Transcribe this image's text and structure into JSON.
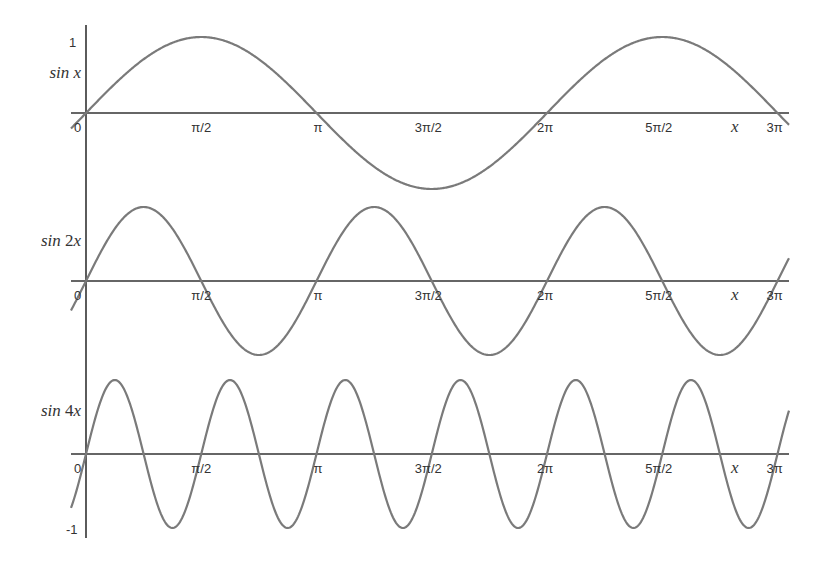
{
  "chart_data": [
    {
      "type": "line",
      "title": "",
      "series": [
        {
          "name": "sin x",
          "function": "sin(1*x)",
          "frequency": 1,
          "amplitude": 1
        }
      ],
      "ylabel": "sin x",
      "xlabel": "x",
      "xlim": [
        0,
        9.4248
      ],
      "ylim": [
        -1,
        1
      ],
      "x_tick_labels": [
        "0",
        "π/2",
        "π",
        "3π/2",
        "2π",
        "5π/2",
        "3π"
      ],
      "y_tick_labels": [
        "1"
      ],
      "grid": false
    },
    {
      "type": "line",
      "title": "",
      "series": [
        {
          "name": "sin 2x",
          "function": "sin(2*x)",
          "frequency": 2,
          "amplitude": 1
        }
      ],
      "ylabel": "sin 2x",
      "xlabel": "x",
      "xlim": [
        0,
        9.4248
      ],
      "ylim": [
        -1,
        1
      ],
      "x_tick_labels": [
        "0",
        "π/2",
        "π",
        "3π/2",
        "2π",
        "5π/2",
        "3π"
      ],
      "grid": false
    },
    {
      "type": "line",
      "title": "",
      "series": [
        {
          "name": "sin 4x",
          "function": "sin(4*x)",
          "frequency": 4,
          "amplitude": 1
        }
      ],
      "ylabel": "sin 4x",
      "xlabel": "x",
      "xlim": [
        0,
        9.4248
      ],
      "ylim": [
        -1,
        1
      ],
      "x_tick_labels": [
        "0",
        "π/2",
        "π",
        "3π/2",
        "2π",
        "5π/2",
        "3π"
      ],
      "y_tick_labels": [
        "-1"
      ],
      "grid": false
    }
  ],
  "panels": [
    {
      "label_fn": "sin",
      "label_coef": "",
      "label_var": "x",
      "freq": 1,
      "axis_y": 113,
      "amp": 76,
      "label_y": 78
    },
    {
      "label_fn": "sin",
      "label_coef": "2",
      "label_var": "x",
      "freq": 2,
      "axis_y": 281,
      "amp": 74,
      "label_y": 246
    },
    {
      "label_fn": "sin",
      "label_coef": "4",
      "label_var": "x",
      "freq": 4,
      "axis_y": 454,
      "amp": 74,
      "label_y": 416
    }
  ],
  "ticks": [
    "0",
    "π/2",
    "π",
    "3π/2",
    "2π",
    "5π/2",
    "3π"
  ],
  "x_var": "x",
  "y_top_label": "1",
  "y_bottom_label": "-1",
  "colors": {
    "axis": "#333333",
    "curve": "#7a7a7a",
    "background": "#ffffff"
  }
}
